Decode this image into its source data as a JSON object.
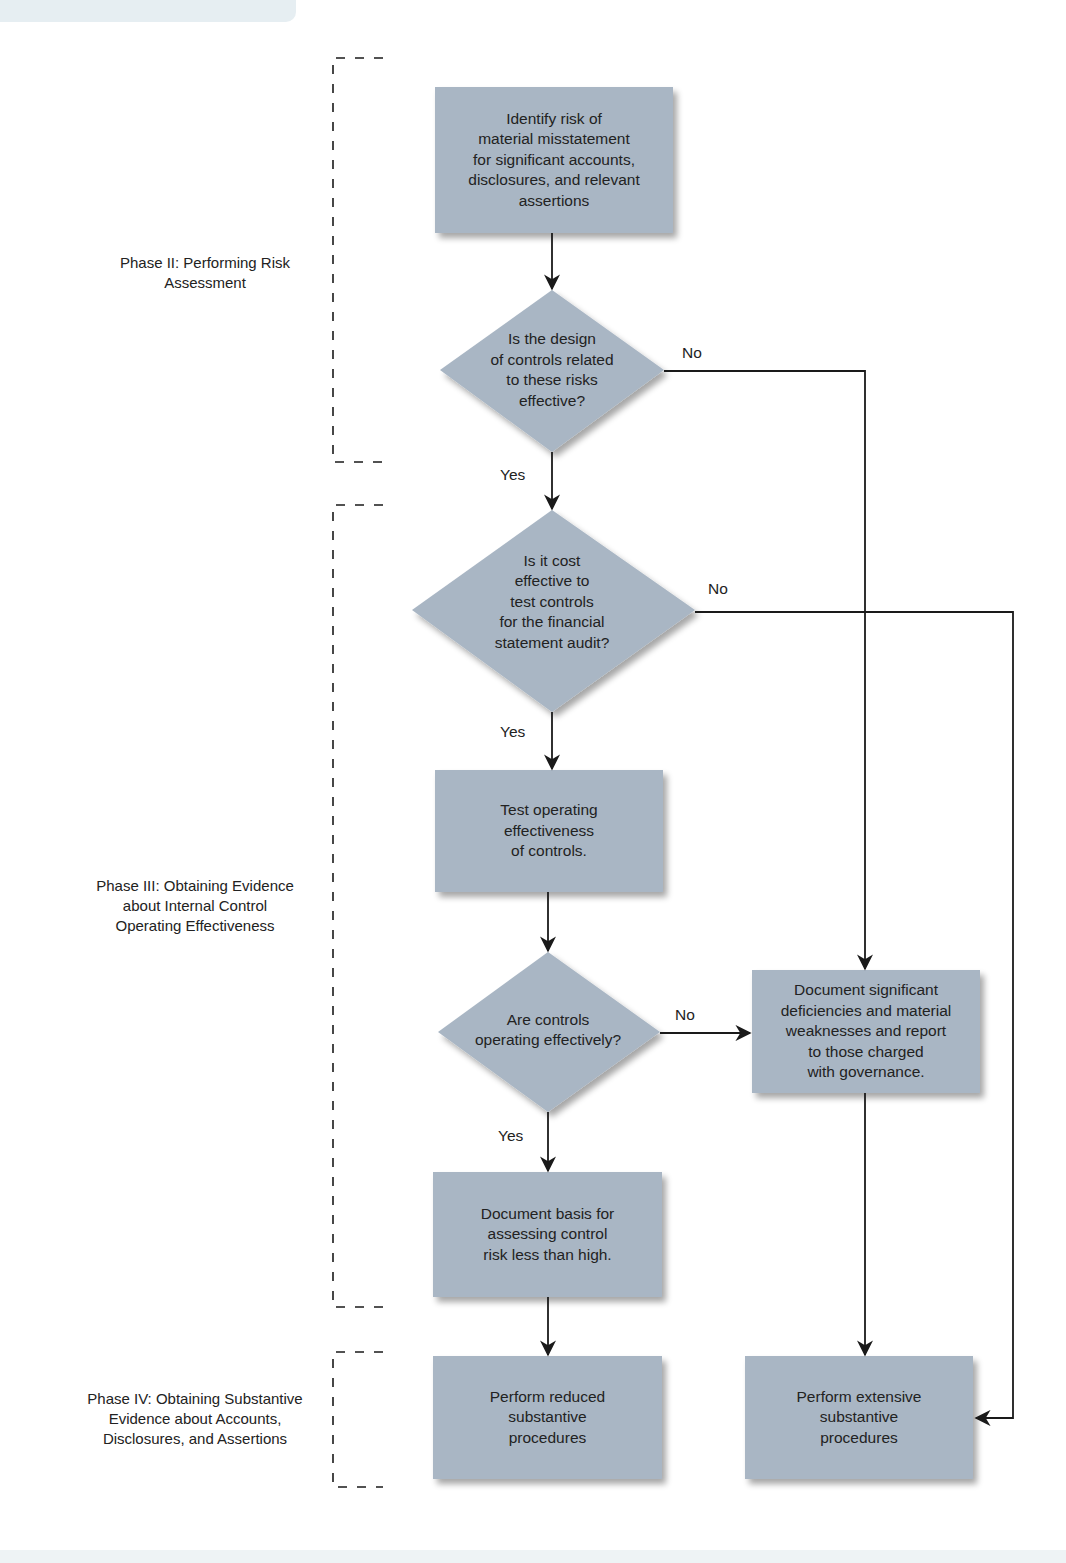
{
  "diagram": {
    "colors": {
      "node_fill": "#a9b6c4",
      "line": "#1a1a1a",
      "background": "#ffffff"
    },
    "phases": [
      {
        "id": "phase2",
        "label": "Phase II: Performing Risk\nAssessment"
      },
      {
        "id": "phase3",
        "label": "Phase III: Obtaining Evidence\nabout Internal Control\nOperating Effectiveness"
      },
      {
        "id": "phase4",
        "label": "Phase IV: Obtaining Substantive\nEvidence about Accounts,\nDisclosures, and Assertions"
      }
    ],
    "nodes": {
      "identify_risk": {
        "shape": "rectangle",
        "text": "Identify risk of\nmaterial misstatement\nfor significant accounts,\ndisclosures, and relevant\nassertions"
      },
      "design_effective": {
        "shape": "diamond",
        "text": "Is the design\nof controls related\nto these risks\neffective?"
      },
      "cost_effective": {
        "shape": "diamond",
        "text": "Is it cost\neffective to\ntest controls\nfor the financial\nstatement audit?"
      },
      "test_operating": {
        "shape": "rectangle",
        "text": "Test operating\neffectiveness\nof controls."
      },
      "operating_effectively": {
        "shape": "diamond",
        "text": "Are controls\noperating effectively?"
      },
      "document_deficiencies": {
        "shape": "rectangle",
        "text": "Document significant\ndeficiencies and material\nweaknesses and report\nto those charged\nwith governance."
      },
      "document_basis": {
        "shape": "rectangle",
        "text": "Document basis for\nassessing control\nrisk less than high."
      },
      "reduced_procedures": {
        "shape": "rectangle",
        "text": "Perform reduced\nsubstantive\nprocedures"
      },
      "extensive_procedures": {
        "shape": "rectangle",
        "text": "Perform extensive\nsubstantive\nprocedures"
      }
    },
    "edges": [
      {
        "from": "identify_risk",
        "to": "design_effective",
        "label": ""
      },
      {
        "from": "design_effective",
        "to": "cost_effective",
        "label": "Yes"
      },
      {
        "from": "design_effective",
        "to": "document_deficiencies",
        "label": "No"
      },
      {
        "from": "cost_effective",
        "to": "test_operating",
        "label": "Yes"
      },
      {
        "from": "cost_effective",
        "to": "extensive_procedures",
        "label": "No"
      },
      {
        "from": "test_operating",
        "to": "operating_effectively",
        "label": ""
      },
      {
        "from": "operating_effectively",
        "to": "document_basis",
        "label": "Yes"
      },
      {
        "from": "operating_effectively",
        "to": "document_deficiencies",
        "label": "No"
      },
      {
        "from": "document_basis",
        "to": "reduced_procedures",
        "label": ""
      },
      {
        "from": "document_deficiencies",
        "to": "extensive_procedures",
        "label": ""
      }
    ],
    "edge_labels": {
      "d1_no": "No",
      "d1_yes": "Yes",
      "d2_no": "No",
      "d2_yes": "Yes",
      "d3_no": "No",
      "d3_yes": "Yes"
    }
  }
}
